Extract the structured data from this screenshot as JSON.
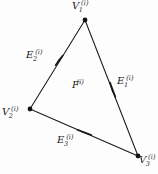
{
  "figure": {
    "type": "geometry-diagram",
    "background_color": "#fdfdfd",
    "stroke_color": "#1a1a1a",
    "vertices": [
      {
        "id": "v1",
        "base": "V",
        "subscript": "1",
        "superscript": "(i)",
        "x": 85,
        "y": 20
      },
      {
        "id": "v2",
        "base": "V",
        "subscript": "2",
        "superscript": "(i)",
        "x": 30,
        "y": 109
      },
      {
        "id": "v3",
        "base": "V",
        "subscript": "3",
        "superscript": "(i)",
        "x": 138,
        "y": 156
      }
    ],
    "edges": [
      {
        "id": "e1",
        "base": "E",
        "subscript": "1",
        "superscript": "(i)",
        "from": "v1",
        "to": "v3",
        "arrow_x": 113,
        "arrow_y": 90
      },
      {
        "id": "e2",
        "base": "E",
        "subscript": "2",
        "superscript": "(i)",
        "from": "v2",
        "to": "v1",
        "arrow_x": 59,
        "arrow_y": 60
      },
      {
        "id": "e3",
        "base": "E",
        "subscript": "3",
        "superscript": "(i)",
        "from": "v3",
        "to": "v2",
        "arrow_x": 84,
        "arrow_y": 132
      }
    ],
    "face": {
      "id": "f",
      "base": "F",
      "subscript": "",
      "superscript": "(i)"
    }
  }
}
